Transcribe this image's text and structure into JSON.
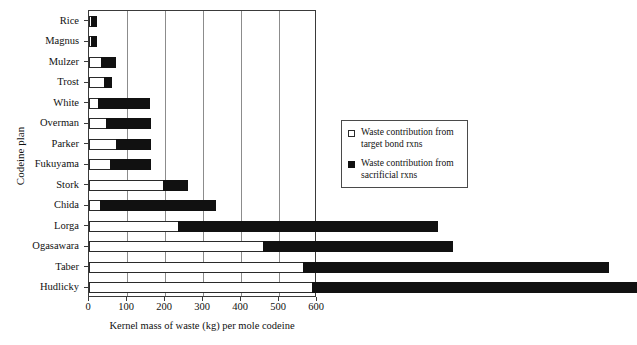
{
  "chart_data": {
    "type": "bar",
    "orientation": "horizontal",
    "stacked": true,
    "title": "",
    "xlabel": "Kernel mass of waste (kg) per mole codeine",
    "ylabel": "Codeine plan",
    "xlim": [
      0,
      600
    ],
    "xticks": [
      0,
      100,
      200,
      300,
      400,
      500,
      600
    ],
    "xtick_labels": [
      "0",
      "100",
      "200",
      "300",
      "400",
      "500",
      "600"
    ],
    "grid": "vertical",
    "categories": [
      "Rice",
      "Magnus",
      "Mulzer",
      "Trost",
      "White",
      "Overman",
      "Parker",
      "Fukuyama",
      "Stork",
      "Chida",
      "Lorga",
      "Ogasawara",
      "Taber",
      "Hudlicky"
    ],
    "series": [
      {
        "name": "Waste contribution from target bond rxns",
        "color": "#ffffff",
        "values": [
          3,
          3,
          34,
          42,
          26,
          47,
          73,
          58,
          197,
          31,
          236,
          460,
          565,
          590
        ]
      },
      {
        "name": "Waste contribution from sacrificial rxns",
        "color": "#111111",
        "values": [
          18,
          18,
          40,
          21,
          137,
          118,
          92,
          107,
          66,
          305,
          686,
          500,
          806,
          855
        ]
      }
    ],
    "bars": [
      {
        "label": "Rice",
        "target": 3,
        "sacrificial": 18,
        "total": 21
      },
      {
        "label": "Magnus",
        "target": 3,
        "sacrificial": 18,
        "total": 21
      },
      {
        "label": "Mulzer",
        "target": 34,
        "sacrificial": 40,
        "total": 74
      },
      {
        "label": "Trost",
        "target": 42,
        "sacrificial": 21,
        "total": 63
      },
      {
        "label": "White",
        "target": 26,
        "sacrificial": 137,
        "total": 163
      },
      {
        "label": "Overman",
        "target": 47,
        "sacrificial": 118,
        "total": 165
      },
      {
        "label": "Parker",
        "target": 73,
        "sacrificial": 92,
        "total": 165
      },
      {
        "label": "Fukuyama",
        "target": 58,
        "sacrificial": 107,
        "total": 165
      },
      {
        "label": "Stork",
        "target": 197,
        "sacrificial": 66,
        "total": 263
      },
      {
        "label": "Chida",
        "target": 31,
        "sacrificial": 305,
        "total": 336
      },
      {
        "label": "Lorga",
        "target": 236,
        "sacrificial": 686,
        "total": 922
      },
      {
        "label": "Ogasawara",
        "target": 460,
        "sacrificial": 500,
        "total": 960
      },
      {
        "label": "Taber",
        "target": 565,
        "sacrificial": 806,
        "total": 1371
      },
      {
        "label": "Hudlicky",
        "target": 590,
        "sacrificial": 855,
        "total": 1445
      }
    ]
  },
  "axes": {
    "y_title": "Codeine plan",
    "x_title": "Kernel mass of waste (kg) per mole codeine",
    "x_tick_labels": [
      "0",
      "100",
      "200",
      "300",
      "400",
      "500",
      "600"
    ],
    "y_tick_labels": [
      "Rice",
      "Magnus",
      "Mulzer",
      "Trost",
      "White",
      "Overman",
      "Parker",
      "Fukuyama",
      "Stork",
      "Chida",
      "Lorga",
      "Ogasawara",
      "Taber",
      "Hudlicky"
    ]
  },
  "legend": {
    "entries": [
      {
        "swatch": "target",
        "label": "Waste contribution from target bond rxns"
      },
      {
        "swatch": "sacrificial",
        "label": "Waste contribution from sacrificial rxns"
      }
    ]
  }
}
